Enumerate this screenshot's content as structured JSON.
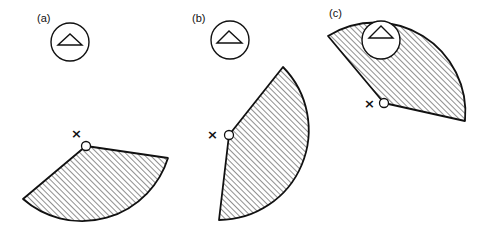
{
  "diagram": {
    "panels": [
      {
        "id": "a",
        "label": "(a)",
        "marker": "×",
        "description": "Sensor with triangle symbol far from sector; hatched sector pointing down-right from pivot"
      },
      {
        "id": "b",
        "label": "(b)",
        "marker": "×",
        "description": "Sensor near sector; hatched sector rotated upward toward sensor"
      },
      {
        "id": "c",
        "label": "(c)",
        "marker": "×",
        "description": "Hatched sector overlaps sensor circle"
      }
    ],
    "colors": {
      "stroke": "#111111",
      "background": "#ffffff",
      "hatch": "#222222"
    }
  }
}
